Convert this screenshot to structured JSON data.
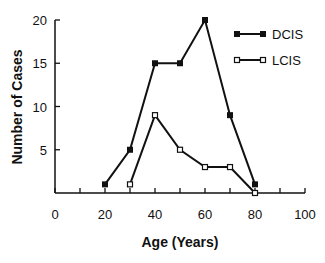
{
  "chart_data": {
    "type": "line",
    "title": "",
    "xlabel": "Age (Years)",
    "ylabel": "Number of Cases",
    "xlim": [
      0,
      100
    ],
    "ylim": [
      0,
      20
    ],
    "xticks": [
      0,
      20,
      40,
      60,
      80,
      100
    ],
    "xminor_ticks": [
      10,
      30,
      50,
      70,
      90
    ],
    "yticks": [
      5,
      10,
      15,
      20
    ],
    "grid": false,
    "legend_position": "upper right",
    "series": [
      {
        "name": "DCIS",
        "marker": "filled-square",
        "color": "#111111",
        "x": [
          20,
          30,
          40,
          50,
          60,
          70,
          80
        ],
        "values": [
          1,
          5,
          15,
          15,
          20,
          9,
          1
        ]
      },
      {
        "name": "LCIS",
        "marker": "open-square",
        "color": "#111111",
        "x": [
          30,
          40,
          50,
          60,
          70,
          80
        ],
        "values": [
          1,
          9,
          5,
          3,
          3,
          0
        ]
      }
    ]
  }
}
